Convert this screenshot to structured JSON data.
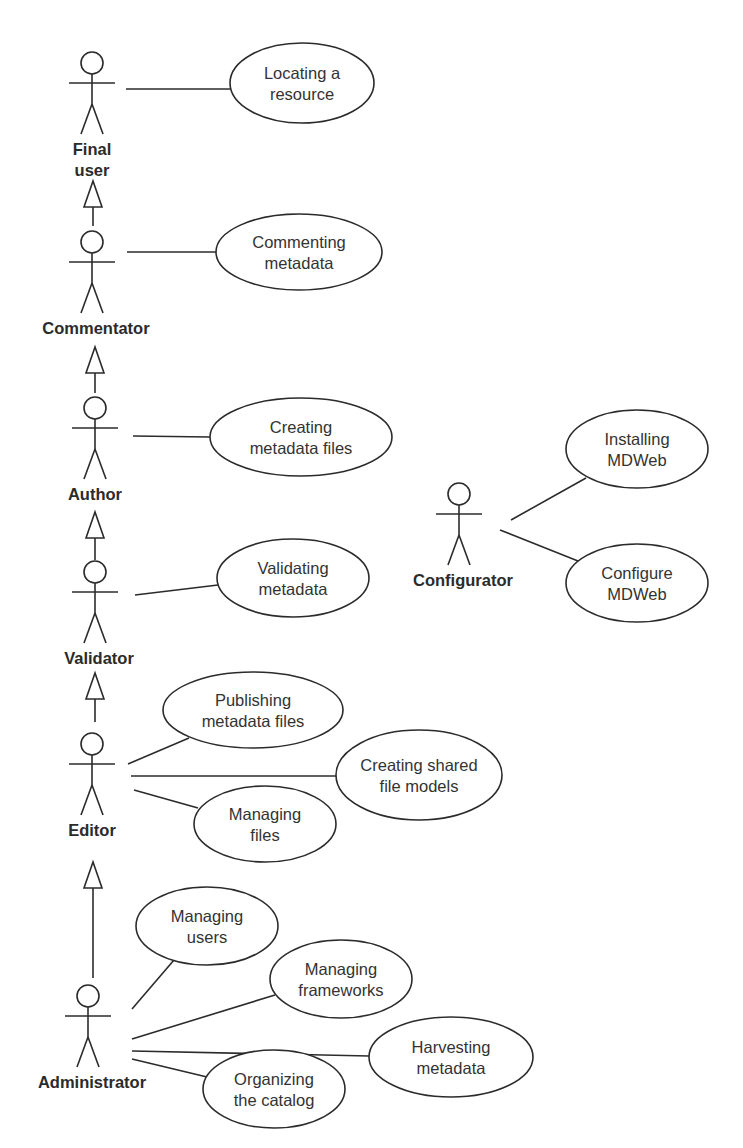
{
  "diagram": {
    "type": "UML use case diagram",
    "colors": {
      "line": "#2b2b2b",
      "text": "#333333",
      "background": "#ffffff"
    },
    "actors": [
      {
        "id": "final_user",
        "label_lines": [
          "Final",
          "user"
        ],
        "x": 92,
        "head_y": 63
      },
      {
        "id": "commentator",
        "label_lines": [
          "Commentator"
        ],
        "x": 92,
        "head_y": 242
      },
      {
        "id": "author",
        "label_lines": [
          "Author"
        ],
        "x": 95,
        "head_y": 408
      },
      {
        "id": "validator",
        "label_lines": [
          "Validator"
        ],
        "x": 95,
        "head_y": 572
      },
      {
        "id": "editor",
        "label_lines": [
          "Editor"
        ],
        "x": 92,
        "head_y": 744
      },
      {
        "id": "administrator",
        "label_lines": [
          "Administrator"
        ],
        "x": 88,
        "head_y": 996
      },
      {
        "id": "configurator",
        "label_lines": [
          "Configurator"
        ],
        "x": 459,
        "head_y": 494
      }
    ],
    "use_cases": [
      {
        "id": "locating",
        "lines": [
          "Locating a",
          "resource"
        ],
        "cx": 302,
        "cy": 83,
        "rx": 72,
        "ry": 40
      },
      {
        "id": "commenting",
        "lines": [
          "Commenting",
          "metadata"
        ],
        "cx": 299,
        "cy": 252,
        "rx": 83,
        "ry": 38
      },
      {
        "id": "creating_files",
        "lines": [
          "Creating",
          "metadata files"
        ],
        "cx": 301,
        "cy": 437,
        "rx": 91,
        "ry": 39
      },
      {
        "id": "validating",
        "lines": [
          "Validating",
          "metadata"
        ],
        "cx": 293,
        "cy": 578,
        "rx": 76,
        "ry": 39
      },
      {
        "id": "publishing",
        "lines": [
          "Publishing",
          "metadata files"
        ],
        "cx": 253,
        "cy": 710,
        "rx": 90,
        "ry": 38
      },
      {
        "id": "shared_models",
        "lines": [
          "Creating shared",
          "file models"
        ],
        "cx": 419,
        "cy": 775,
        "rx": 83,
        "ry": 45
      },
      {
        "id": "managing_files",
        "lines": [
          "Managing",
          "files"
        ],
        "cx": 265,
        "cy": 824,
        "rx": 71,
        "ry": 38
      },
      {
        "id": "managing_users",
        "lines": [
          "Managing",
          "users"
        ],
        "cx": 207,
        "cy": 926,
        "rx": 71,
        "ry": 39
      },
      {
        "id": "managing_frameworks",
        "lines": [
          "Managing",
          "frameworks"
        ],
        "cx": 341,
        "cy": 979,
        "rx": 71,
        "ry": 39
      },
      {
        "id": "harvesting",
        "lines": [
          "Harvesting",
          "metadata"
        ],
        "cx": 451,
        "cy": 1057,
        "rx": 82,
        "ry": 40
      },
      {
        "id": "organizing",
        "lines": [
          "Organizing",
          "the catalog"
        ],
        "cx": 274,
        "cy": 1089,
        "rx": 71,
        "ry": 39
      },
      {
        "id": "installing",
        "lines": [
          "Installing",
          "MDWeb"
        ],
        "cx": 637,
        "cy": 449,
        "rx": 71,
        "ry": 39
      },
      {
        "id": "configure",
        "lines": [
          "Configure",
          "MDWeb"
        ],
        "cx": 637,
        "cy": 583,
        "rx": 71,
        "ry": 39
      }
    ],
    "associations": [
      {
        "from": "final_user",
        "to": "locating",
        "x1": 126,
        "y1": 89,
        "x2": 230,
        "y2": 89
      },
      {
        "from": "commentator",
        "to": "commenting",
        "x1": 127,
        "y1": 252,
        "x2": 216,
        "y2": 252
      },
      {
        "from": "author",
        "to": "creating_files",
        "x1": 133,
        "y1": 436,
        "x2": 210,
        "y2": 437
      },
      {
        "from": "validator",
        "to": "validating",
        "x1": 135,
        "y1": 595,
        "x2": 218,
        "y2": 585
      },
      {
        "from": "editor",
        "to": "publishing",
        "x1": 128,
        "y1": 764,
        "x2": 189,
        "y2": 738
      },
      {
        "from": "editor",
        "to": "shared_models",
        "x1": 131,
        "y1": 776,
        "x2": 336,
        "y2": 776
      },
      {
        "from": "editor",
        "to": "managing_files",
        "x1": 134,
        "y1": 790,
        "x2": 198,
        "y2": 808
      },
      {
        "from": "administrator",
        "to": "managing_users",
        "x1": 132,
        "y1": 1009,
        "x2": 174,
        "y2": 960
      },
      {
        "from": "administrator",
        "to": "managing_frameworks",
        "x1": 132,
        "y1": 1039,
        "x2": 275,
        "y2": 995
      },
      {
        "from": "administrator",
        "to": "harvesting",
        "x1": 132,
        "y1": 1051,
        "x2": 369,
        "y2": 1056
      },
      {
        "from": "administrator",
        "to": "organizing",
        "x1": 132,
        "y1": 1059,
        "x2": 207,
        "y2": 1077
      },
      {
        "from": "configurator",
        "to": "installing",
        "x1": 511,
        "y1": 520,
        "x2": 586,
        "y2": 478
      },
      {
        "from": "configurator",
        "to": "configure",
        "x1": 500,
        "y1": 530,
        "x2": 578,
        "y2": 561
      }
    ],
    "generalizations": [
      {
        "child": "commentator",
        "parent": "final_user",
        "x": 93,
        "apex_y": 181,
        "base_y": 207,
        "stem_end_y": 226
      },
      {
        "child": "author",
        "parent": "commentator",
        "x": 95,
        "apex_y": 347,
        "base_y": 373,
        "stem_end_y": 393
      },
      {
        "child": "validator",
        "parent": "author",
        "x": 95,
        "apex_y": 512,
        "base_y": 538,
        "stem_end_y": 560
      },
      {
        "child": "editor",
        "parent": "validator",
        "x": 95,
        "apex_y": 673,
        "base_y": 699,
        "stem_end_y": 722
      },
      {
        "child": "administrator",
        "parent": "editor",
        "x": 93,
        "apex_y": 862,
        "base_y": 888,
        "stem_end_y": 978
      }
    ]
  }
}
